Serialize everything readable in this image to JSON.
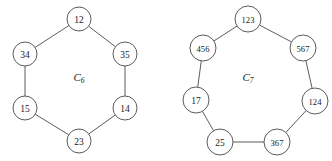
{
  "figure": {
    "background_color": "#ffffff",
    "stroke_color": "#4a4a4a",
    "text_color": "#1a1a1a",
    "width": 332,
    "height": 161
  },
  "graphs": [
    {
      "id": "c6",
      "caption_base": "C",
      "caption_subscript": "6",
      "caption_x": 79,
      "caption_y": 77,
      "center_x": 79,
      "center_y": 80,
      "node_radius": 12,
      "nodes": [
        {
          "label": "12",
          "x": 79,
          "y": 19,
          "digits": 2
        },
        {
          "label": "35",
          "x": 125,
          "y": 54,
          "digits": 2
        },
        {
          "label": "14",
          "x": 125,
          "y": 108,
          "digits": 2
        },
        {
          "label": "23",
          "x": 79,
          "y": 141,
          "digits": 2
        },
        {
          "label": "15",
          "x": 25,
          "y": 108,
          "digits": 2
        },
        {
          "label": "34",
          "x": 25,
          "y": 54,
          "digits": 2
        }
      ],
      "edges": [
        [
          0,
          1
        ],
        [
          1,
          2
        ],
        [
          2,
          3
        ],
        [
          3,
          4
        ],
        [
          4,
          5
        ],
        [
          5,
          0
        ]
      ]
    },
    {
      "id": "c7",
      "caption_base": "C",
      "caption_subscript": "7",
      "caption_x": 248,
      "caption_y": 77,
      "center_x": 248,
      "center_y": 81,
      "node_radius": 13,
      "nodes": [
        {
          "label": "123",
          "x": 248,
          "y": 19,
          "digits": 3
        },
        {
          "label": "567",
          "x": 303,
          "y": 48,
          "digits": 3
        },
        {
          "label": "124",
          "x": 315,
          "y": 101,
          "digits": 3
        },
        {
          "label": "367",
          "x": 277,
          "y": 142,
          "digits": 3
        },
        {
          "label": "25",
          "x": 220,
          "y": 142,
          "digits": 2
        },
        {
          "label": "17",
          "x": 196,
          "y": 100,
          "digits": 2
        },
        {
          "label": "456",
          "x": 203,
          "y": 48,
          "digits": 3
        }
      ],
      "edges": [
        [
          0,
          1
        ],
        [
          1,
          2
        ],
        [
          2,
          3
        ],
        [
          3,
          4
        ],
        [
          4,
          5
        ],
        [
          5,
          6
        ],
        [
          6,
          0
        ]
      ]
    }
  ],
  "chart_data": {
    "type": "diagram",
    "diagram_kind": "graph-cycle",
    "title": "",
    "graphs": [
      {
        "name": "C6",
        "vertex_count": 6,
        "edge_count": 6,
        "vertex_labels": [
          "12",
          "35",
          "14",
          "23",
          "15",
          "34"
        ],
        "edges": [
          [
            "12",
            "35"
          ],
          [
            "35",
            "14"
          ],
          [
            "14",
            "23"
          ],
          [
            "23",
            "15"
          ],
          [
            "15",
            "34"
          ],
          [
            "34",
            "12"
          ]
        ],
        "layout": "regular hexagon, vertex at top"
      },
      {
        "name": "C7",
        "vertex_count": 7,
        "edge_count": 7,
        "vertex_labels": [
          "123",
          "567",
          "124",
          "367",
          "25",
          "17",
          "456"
        ],
        "edges": [
          [
            "123",
            "567"
          ],
          [
            "567",
            "124"
          ],
          [
            "124",
            "367"
          ],
          [
            "367",
            "25"
          ],
          [
            "25",
            "17"
          ],
          [
            "17",
            "456"
          ],
          [
            "456",
            "123"
          ]
        ],
        "layout": "regular heptagon, vertex at top"
      }
    ]
  }
}
